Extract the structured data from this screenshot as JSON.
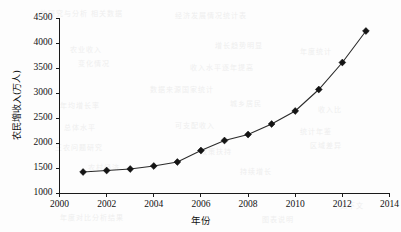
{
  "chart_data": {
    "type": "line",
    "title": "",
    "xlabel": "年份",
    "ylabel": "农民增收入(万人)",
    "x": [
      2001,
      2002,
      2003,
      2004,
      2005,
      2006,
      2007,
      2008,
      2009,
      2010,
      2011,
      2012,
      2013
    ],
    "values": [
      1430,
      1460,
      1490,
      1550,
      1630,
      1860,
      2060,
      2180,
      2390,
      2650,
      3080,
      3620,
      4250
    ],
    "series": [
      {
        "name": "农民增收入(万人)",
        "values": [
          1430,
          1460,
          1490,
          1550,
          1630,
          1860,
          2060,
          2180,
          2390,
          2650,
          3080,
          3620,
          4250
        ]
      }
    ],
    "xlim": [
      2000,
      2014
    ],
    "ylim": [
      1000,
      4500
    ],
    "xticks": [
      2000,
      2002,
      2004,
      2006,
      2008,
      2010,
      2012,
      2014
    ],
    "xtick_labels": [
      "2000",
      "2002",
      "2004",
      "2006",
      "2008",
      "2010",
      "2012",
      "2014"
    ],
    "yticks": [
      1000,
      1500,
      2000,
      2500,
      3000,
      3500,
      4000,
      4500
    ],
    "ytick_labels": [
      "1000",
      "1500",
      "2000",
      "2500",
      "3000",
      "3500",
      "4000",
      "4500"
    ],
    "grid": false,
    "legend": null,
    "legend_position": "none",
    "marker": "diamond",
    "line_color": "#2b2b2b",
    "marker_color": "#141414",
    "background_color": "#fdfdfd"
  },
  "background_noise": [
    {
      "text": "的研究与分析 相关数据",
      "x": 40,
      "y": 8
    },
    {
      "text": "经济发展情况统计表",
      "x": 175,
      "y": 10
    },
    {
      "text": "农业收入",
      "x": 70,
      "y": 44
    },
    {
      "text": "增长趋势明显",
      "x": 215,
      "y": 40
    },
    {
      "text": "年度统计",
      "x": 300,
      "y": 46
    },
    {
      "text": "变化情况",
      "x": 78,
      "y": 58
    },
    {
      "text": "收入水平逐年提高",
      "x": 190,
      "y": 62
    },
    {
      "text": "数据来源国家统计",
      "x": 150,
      "y": 84
    },
    {
      "text": "年均增长率",
      "x": 60,
      "y": 100
    },
    {
      "text": "城乡居民",
      "x": 230,
      "y": 98
    },
    {
      "text": "收入比",
      "x": 318,
      "y": 104
    },
    {
      "text": "总体水平",
      "x": 64,
      "y": 122
    },
    {
      "text": "可支配收入",
      "x": 175,
      "y": 120
    },
    {
      "text": "统计年鉴",
      "x": 300,
      "y": 126
    },
    {
      "text": "三农问题研究",
      "x": 55,
      "y": 142
    },
    {
      "text": "政策扶持",
      "x": 200,
      "y": 146
    },
    {
      "text": "区域差异",
      "x": 310,
      "y": 140
    },
    {
      "text": "农村经济",
      "x": 88,
      "y": 162
    },
    {
      "text": "持续增长",
      "x": 240,
      "y": 166
    },
    {
      "text": "年度对比分析结果",
      "x": 60,
      "y": 212
    },
    {
      "text": "图表说明",
      "x": 262,
      "y": 214
    },
    {
      "text": "见下文",
      "x": 340,
      "y": 200
    }
  ],
  "axes": {
    "x_axis_label": "年份",
    "y_axis_label": "农民增收入(万人)"
  }
}
